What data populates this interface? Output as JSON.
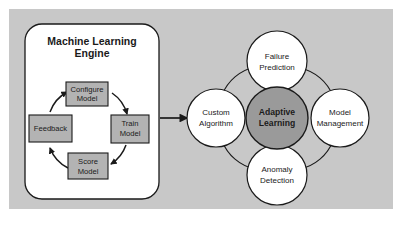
{
  "figure": {
    "background_color": "#c8c8c8",
    "panel_color": "#ffffff",
    "node_fill": "#b3b3b3",
    "highlight_fill": "#9a9a9a",
    "circle_fill": "#ffffff",
    "stroke_color": "#1a1a1a"
  },
  "engine_panel": {
    "title_line1": "Machine Learning",
    "title_line2": "Engine",
    "cycle_nodes": [
      {
        "id": "configure-model",
        "line1": "Configure",
        "line2": "Model"
      },
      {
        "id": "train-model",
        "line1": "Train",
        "line2": "Model"
      },
      {
        "id": "score-model",
        "line1": "Score",
        "line2": "Model"
      },
      {
        "id": "feedback",
        "line1": "Feedback",
        "line2": ""
      }
    ]
  },
  "capabilities": {
    "center": {
      "id": "adaptive-learning",
      "line1": "Adaptive",
      "line2": "Learning"
    },
    "satellites": [
      {
        "id": "custom-algorithm",
        "line1": "Custom",
        "line2": "Algorithm"
      },
      {
        "id": "failure-prediction",
        "line1": "Failure",
        "line2": "Prediction"
      },
      {
        "id": "model-management",
        "line1": "Model",
        "line2": "Management"
      },
      {
        "id": "anomaly-detection",
        "line1": "Anomaly",
        "line2": "Detection"
      }
    ]
  },
  "connector": {
    "id": "engine-to-capabilities-arrow",
    "label": ""
  }
}
